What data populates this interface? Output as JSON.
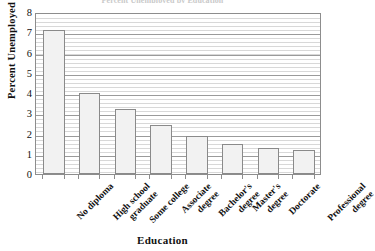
{
  "chart_data": {
    "type": "bar",
    "title": "Percent Unemployed by Education",
    "xlabel": "Education",
    "ylabel": "Percent Unemployed",
    "categories": [
      "No diploma",
      "High school graduate",
      "Some college",
      "Associate degree",
      "Bachelor's degree",
      "Master's degree",
      "Doctorate",
      "Professional degree"
    ],
    "category_lines": [
      [
        "No diploma"
      ],
      [
        "High school",
        "graduate"
      ],
      [
        "Some college"
      ],
      [
        "Associate",
        "degree"
      ],
      [
        "Bachelor's",
        "degree"
      ],
      [
        "Master's",
        "degree"
      ],
      [
        "Doctorate"
      ],
      [
        "Professional",
        "degree"
      ]
    ],
    "values": [
      7.1,
      4.0,
      3.2,
      2.4,
      1.9,
      1.5,
      1.3,
      1.2
    ],
    "ylim": [
      0,
      8
    ],
    "yticks": [
      0,
      1,
      2,
      3,
      4,
      5,
      6,
      7,
      8
    ],
    "ytick_labels": [
      "0",
      "1",
      "2",
      "3",
      "4",
      "5",
      "6",
      "7",
      "8"
    ],
    "grid": true,
    "minor_grid": true,
    "minor_grid_step": 0.2,
    "legend": null,
    "bar_color": "#f2f2f2",
    "bar_border_color": "#8a8a8a",
    "grid_color": "#9a9a9a",
    "minor_grid_color": "#d8d8d8",
    "axis_color": "#8d8d8d",
    "text_color": "#111111"
  }
}
